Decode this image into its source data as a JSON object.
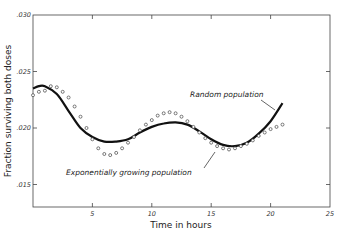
{
  "chart_data": {
    "type": "line",
    "title": "",
    "xlabel": "Time in hours",
    "ylabel": "Fraction surviving both doses",
    "xlim": [
      0,
      25
    ],
    "ylim": [
      0.0125,
      0.03
    ],
    "x_ticks": [
      "5",
      "10",
      "15",
      "20",
      "25"
    ],
    "y_ticks": [
      ".030",
      ".025",
      ".020",
      ".015"
    ],
    "grid": false,
    "legend": "inline annotations",
    "series": [
      {
        "name": "Random population",
        "style": "solid",
        "x": [
          0,
          0.5,
          1,
          2,
          3,
          4,
          5,
          6,
          7,
          8,
          9,
          10,
          11,
          12,
          13,
          14,
          15,
          16,
          17,
          18,
          19,
          20,
          21
        ],
        "values": [
          0.0235,
          0.0237,
          0.0237,
          0.023,
          0.0215,
          0.02,
          0.0192,
          0.0188,
          0.0188,
          0.019,
          0.0196,
          0.0201,
          0.0204,
          0.0205,
          0.0203,
          0.0197,
          0.019,
          0.0185,
          0.0184,
          0.0187,
          0.0195,
          0.0206,
          0.0222
        ]
      },
      {
        "name": "Exponentially growing population",
        "style": "open circles",
        "x": [
          0,
          0.5,
          1,
          1.5,
          2,
          2.5,
          3,
          3.5,
          4,
          4.5,
          5,
          5.5,
          6,
          6.5,
          7,
          7.5,
          8,
          8.5,
          9,
          9.5,
          10,
          10.5,
          11,
          11.5,
          12,
          12.5,
          13,
          13.5,
          14,
          14.5,
          15,
          15.5,
          16,
          16.5,
          17,
          17.5,
          18,
          18.5,
          19,
          19.5,
          20,
          20.5,
          21
        ],
        "values": [
          0.0229,
          0.0232,
          0.0233,
          0.0237,
          0.0236,
          0.0232,
          0.0227,
          0.0219,
          0.021,
          0.02,
          0.019,
          0.0182,
          0.0177,
          0.0176,
          0.0178,
          0.0182,
          0.0187,
          0.0192,
          0.0198,
          0.0203,
          0.0207,
          0.0211,
          0.0213,
          0.0214,
          0.0213,
          0.021,
          0.0206,
          0.0201,
          0.0196,
          0.0191,
          0.0187,
          0.0184,
          0.0182,
          0.0181,
          0.0182,
          0.0184,
          0.0186,
          0.0189,
          0.0193,
          0.0196,
          0.0199,
          0.0201,
          0.0203
        ]
      }
    ]
  },
  "labels": {
    "xlabel": "Time in hours",
    "ylabel": "Fraction surviving both doses",
    "random_population": "Random population",
    "exponential_population": "Exponentially growing population",
    "x_tick_5": "5",
    "x_tick_10": "10",
    "x_tick_15": "15",
    "x_tick_20": "20",
    "x_tick_25": "25",
    "y_tick_030": ".030",
    "y_tick_025": ".025",
    "y_tick_020": ".020",
    "y_tick_015": ".015"
  }
}
